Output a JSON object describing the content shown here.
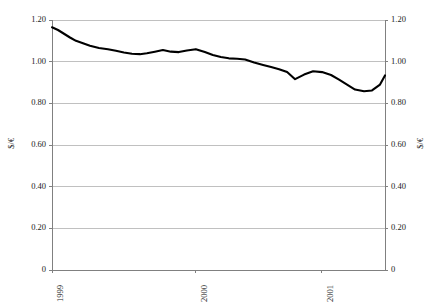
{
  "chart_data": {
    "type": "line",
    "title": "",
    "subtitle": "",
    "xlabel": "",
    "ylabel": "$/€",
    "ylabel_right": "$/€",
    "ylim": [
      0,
      1.2
    ],
    "grid": true,
    "legend": null,
    "line_color": "#000000",
    "gridline_color": "#c0c0c0",
    "axis_color": "#808080",
    "y_ticks": [
      {
        "value": 1.2,
        "label": "1.20"
      },
      {
        "value": 1.0,
        "label": "1.00"
      },
      {
        "value": 0.8,
        "label": "0.80"
      },
      {
        "value": 0.6,
        "label": "0.60"
      },
      {
        "value": 0.4,
        "label": "0.40"
      },
      {
        "value": 0.2,
        "label": "0.20"
      },
      {
        "value": 0.0,
        "label": "0"
      }
    ],
    "x_ticks": [
      {
        "position": 0.0,
        "label": "1999"
      },
      {
        "position": 0.4324,
        "label": "2000"
      },
      {
        "position": 0.8108,
        "label": "2001"
      }
    ],
    "series": [
      {
        "name": "Dollar per Euro exchange rate",
        "x": [
          0.0,
          0.018,
          0.036,
          0.054,
          0.072,
          0.093,
          0.114,
          0.141,
          0.168,
          0.192,
          0.216,
          0.24,
          0.264,
          0.285,
          0.309,
          0.333,
          0.357,
          0.381,
          0.405,
          0.432,
          0.459,
          0.483,
          0.507,
          0.531,
          0.556,
          0.58,
          0.607,
          0.634,
          0.658,
          0.682,
          0.706,
          0.73,
          0.757,
          0.784,
          0.811,
          0.838,
          0.862,
          0.886,
          0.91,
          0.937,
          0.961,
          0.985,
          1.0
        ],
        "values": [
          1.165,
          1.155,
          1.138,
          1.12,
          1.103,
          1.09,
          1.078,
          1.068,
          1.062,
          1.055,
          1.046,
          1.038,
          1.036,
          1.038,
          1.045,
          1.055,
          1.05,
          1.048,
          1.052,
          1.062,
          1.048,
          1.034,
          1.022,
          1.014,
          1.012,
          1.01,
          0.996,
          0.982,
          0.972,
          0.962,
          0.948,
          0.916,
          0.936,
          0.952,
          0.95,
          0.938,
          0.916,
          0.892,
          0.868,
          0.858,
          0.86,
          0.88,
          0.906
        ]
      }
    ],
    "series_display": {
      "name": "Dollar per Euro exchange rate",
      "x": [
        0.0,
        0.018,
        0.036,
        0.054,
        0.072,
        0.093,
        0.114,
        0.141,
        0.168,
        0.192,
        0.216,
        0.24,
        0.264,
        0.285,
        0.309,
        0.333,
        0.357,
        0.381,
        0.405,
        0.432,
        0.459,
        0.483,
        0.507,
        0.531,
        0.556,
        0.58,
        0.607,
        0.634,
        0.658,
        0.682,
        0.706,
        0.73,
        0.757,
        0.784,
        0.811,
        0.838,
        0.862,
        0.886,
        0.91,
        0.937,
        0.961,
        0.985,
        1.0
      ],
      "values": [
        1.165,
        1.152,
        1.134,
        1.116,
        1.1,
        1.088,
        1.076,
        1.066,
        1.06,
        1.052,
        1.044,
        1.038,
        1.036,
        1.04,
        1.048,
        1.056,
        1.048,
        1.046,
        1.054,
        1.06,
        1.046,
        1.032,
        1.022,
        1.016,
        1.014,
        1.01,
        0.996,
        0.984,
        0.974,
        0.964,
        0.95,
        0.916,
        0.938,
        0.954,
        0.95,
        0.936,
        0.914,
        0.89,
        0.866,
        0.858,
        0.862,
        0.89,
        0.934
      ]
    }
  },
  "geometry": {
    "plot_left": 52,
    "plot_right": 385,
    "plot_top": 20,
    "plot_bottom": 270,
    "width": 440,
    "height": 308
  }
}
